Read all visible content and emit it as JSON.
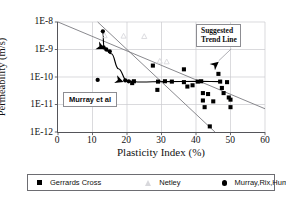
{
  "chart_data": {
    "type": "scatter",
    "title": "",
    "xlabel": "Plasticity Index (%)",
    "ylabel": "Permeability (m/s)",
    "xlim": [
      0,
      60
    ],
    "ylim": [
      1e-12,
      1e-08
    ],
    "yscale": "log",
    "grid": true,
    "xticks": [
      "0",
      "10",
      "20",
      "30",
      "40",
      "50",
      "60"
    ],
    "yticks": [
      "1E-8",
      "1E-9",
      "1E-10",
      "1E-11",
      "1E-12"
    ],
    "legend_position": "bottom",
    "series": [
      {
        "name": "Gerrards Cross",
        "marker": "square",
        "color": "#000000",
        "points": [
          [
            21.5,
            6e-11
          ],
          [
            22.0,
            7e-11
          ],
          [
            27.5,
            2.6e-10
          ],
          [
            28.8,
            3.4e-11
          ],
          [
            29.0,
            6.8e-11
          ],
          [
            31.0,
            7e-11
          ],
          [
            33.0,
            6.8e-11
          ],
          [
            36.5,
            1.9e-10
          ],
          [
            36.5,
            6.5e-11
          ],
          [
            37.5,
            4.5e-11
          ],
          [
            39.0,
            5e-11
          ],
          [
            40.5,
            6.8e-11
          ],
          [
            41.5,
            7e-11
          ],
          [
            42.0,
            2.6e-11
          ],
          [
            42.0,
            1.4e-11
          ],
          [
            42.5,
            8e-12
          ],
          [
            43.5,
            2.4e-11
          ],
          [
            44.0,
            1.6e-12
          ],
          [
            45.0,
            1.3e-11
          ],
          [
            46.5,
            1.3e-10
          ],
          [
            47.0,
            6.8e-11
          ],
          [
            47.5,
            4e-11
          ],
          [
            48.0,
            2.6e-11
          ],
          [
            49.0,
            6.5e-11
          ],
          [
            49.5,
            1.8e-11
          ],
          [
            50.0,
            1.5e-11
          ],
          [
            50.0,
            8e-12
          ]
        ]
      },
      {
        "name": "Netley",
        "marker": "triangle",
        "color": "#d8d8dc",
        "points": [
          [
            13.5,
            3.2e-09
          ],
          [
            19.0,
            3.1e-09
          ],
          [
            25.0,
            3e-09
          ],
          [
            29.5,
            3.8e-10
          ],
          [
            31.5,
            3.6e-10
          ]
        ]
      },
      {
        "name": "Murray,Rix,Humphrey",
        "marker": "circle",
        "color": "#000000",
        "points": [
          [
            11.5,
            7.8e-11
          ],
          [
            13.0,
            4.6e-09
          ],
          [
            13.2,
            1.2e-09
          ],
          [
            14.0,
            1e-09
          ],
          [
            15.0,
            8.5e-10
          ],
          [
            19.5,
            7.5e-11
          ],
          [
            20.5,
            7e-11
          ]
        ]
      }
    ],
    "annotations": [
      {
        "id": "suggested-trend-line",
        "text": "Suggested Trend Line",
        "x": 48.5,
        "y": 1.2e-09
      },
      {
        "id": "murray-et-al",
        "text": "Murray et al",
        "x": 14.0,
        "y": 1.2e-11
      }
    ],
    "trend_lines": [
      {
        "id": "upper-trend-line",
        "from": [
          0,
          1e-08
        ],
        "to": [
          60,
          7e-12
        ]
      },
      {
        "id": "lower-trend-line",
        "from": [
          11.5,
          1e-08
        ],
        "to": [
          45.5,
          1e-12
        ]
      }
    ],
    "murray_curve": {
      "id": "murray-curve",
      "points": [
        [
          13.0,
          4.6e-09
        ],
        [
          13.3,
          1.15e-09
        ],
        [
          15.5,
          7e-10
        ],
        [
          17.5,
          2e-10
        ],
        [
          20.0,
          7.2e-11
        ],
        [
          24.0,
          6.6e-11
        ],
        [
          31.0,
          6.8e-11
        ],
        [
          41.0,
          6.9e-11
        ],
        [
          47.5,
          6.8e-11
        ]
      ]
    },
    "arrow_markers": [
      {
        "id": "arrow-murray-upper",
        "x": 13.6,
        "y": 1.05e-09
      },
      {
        "id": "arrow-murray-lower",
        "x": 19.0,
        "y": 6.6e-11
      },
      {
        "id": "arrow-trend-line",
        "x": 46.6,
        "y": 3.6e-10
      }
    ]
  },
  "axes": {
    "y_title": "Permeability (m/s)",
    "x_title": "Plasticity Index (%)",
    "y_ticks": [
      "1E-8",
      "1E-9",
      "1E-10",
      "1E-11",
      "1E-12"
    ],
    "x_ticks": [
      "0",
      "10",
      "20",
      "30",
      "40",
      "50",
      "60"
    ]
  },
  "annotations": {
    "trend_label": "Suggested Trend Line",
    "trend_label_line1": "Suggested",
    "trend_label_line2": "Trend Line",
    "murray_label": "Murray et al"
  },
  "legend": {
    "items": [
      {
        "label": "Gerrards Cross",
        "marker": "square-marker",
        "color": "#000000"
      },
      {
        "label": "Netley",
        "marker": "triangle-marker",
        "color": "#d8d8dc"
      },
      {
        "label": "Murray,Rix,Humphrey",
        "marker": "circle-marker",
        "color": "#000000"
      }
    ]
  },
  "colors": {
    "axis": "#55555a",
    "grid": "#c9c9ce",
    "trend": "#7a7a80",
    "data": "#000000",
    "netley": "#d8d8dc"
  }
}
